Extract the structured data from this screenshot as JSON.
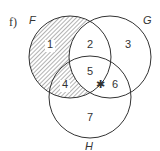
{
  "diagram": {
    "part_label": "f)",
    "sets": [
      {
        "name": "F",
        "cx": 70,
        "cy": 57,
        "r": 41
      },
      {
        "name": "G",
        "cx": 110,
        "cy": 57,
        "r": 41
      },
      {
        "name": "H",
        "cx": 90,
        "cy": 97,
        "r": 41
      }
    ],
    "regions": [
      {
        "id": "1",
        "x": 50,
        "y": 48,
        "shaded": true
      },
      {
        "id": "2",
        "x": 90,
        "y": 48,
        "shaded": false
      },
      {
        "id": "3",
        "x": 128,
        "y": 48,
        "shaded": false
      },
      {
        "id": "4",
        "x": 65,
        "y": 88,
        "shaded": true
      },
      {
        "id": "5",
        "x": 90,
        "y": 75,
        "shaded": false
      },
      {
        "id": "6",
        "x": 115,
        "y": 88,
        "shaded": false
      },
      {
        "id": "7",
        "x": 90,
        "y": 121,
        "shaded": false
      }
    ],
    "marker": {
      "symbol": "✱",
      "x": 100,
      "y": 84
    },
    "shaded_description": "F minus G (regions 1 and 4)",
    "line_color": "#333333",
    "hatch_color": "#555555"
  }
}
